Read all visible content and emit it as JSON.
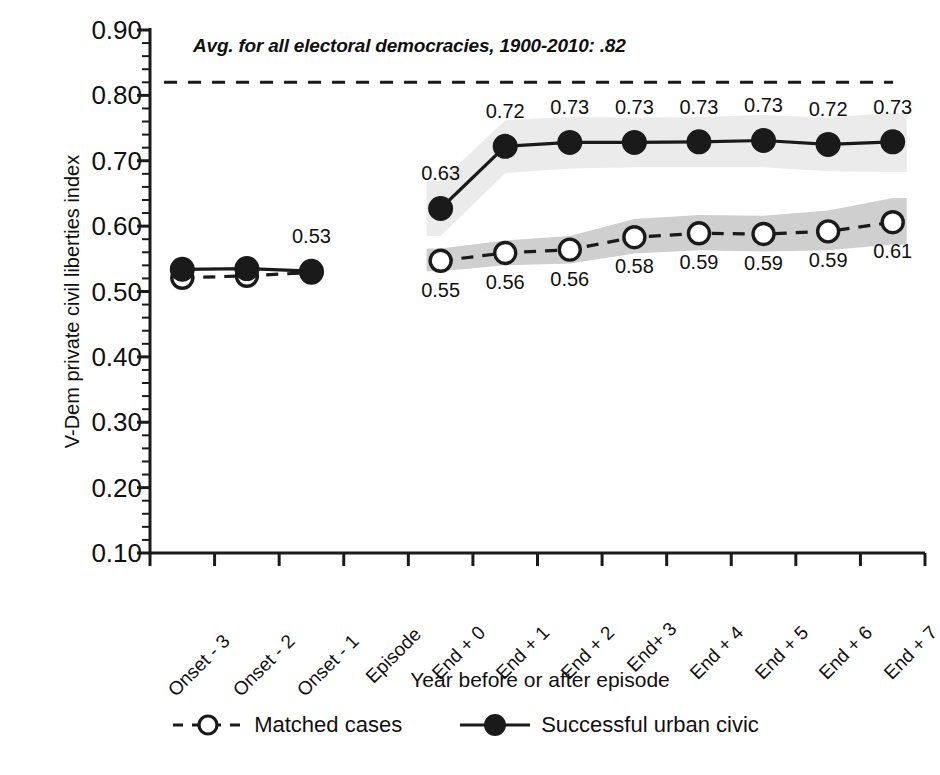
{
  "chart_data": {
    "type": "line",
    "title": "",
    "xlabel": "Year before or after episode",
    "ylabel": "V-Dem private civil liberties index",
    "ylim": [
      0.1,
      0.9
    ],
    "ytick_labels": [
      "0.90",
      "0.80",
      "0.70",
      "0.60",
      "0.50",
      "0.40",
      "0.30",
      "0.20",
      "0.10"
    ],
    "ytick_values": [
      0.9,
      0.8,
      0.7,
      0.6,
      0.5,
      0.4,
      0.3,
      0.2,
      0.1
    ],
    "minor_ticks_per_interval": 5,
    "grid": false,
    "legend_position": "bottom",
    "categories": [
      "Onset - 3",
      "Onset - 2",
      "Onset - 1",
      "Episode",
      "End + 0",
      "End + 1",
      "End + 2",
      "End+ 3",
      "End + 4",
      "End + 5",
      "End + 6",
      "End + 7"
    ],
    "series": [
      {
        "name": "Matched cases",
        "style": "dashed",
        "marker": "open-circle",
        "values": [
          0.521,
          0.524,
          0.529,
          null,
          0.547,
          0.559,
          0.564,
          0.583,
          0.589,
          0.588,
          0.592,
          0.606
        ],
        "labels": [
          "",
          "",
          "",
          "",
          "0.55",
          "0.56",
          "0.56",
          "0.58",
          "0.59",
          "0.59",
          "0.59",
          "0.61"
        ],
        "label_position": "below",
        "band_color": "#cfcfcf",
        "band_lower": [
          null,
          null,
          null,
          null,
          0.531,
          0.54,
          0.543,
          0.558,
          0.563,
          0.561,
          0.563,
          0.572
        ],
        "band_upper": [
          null,
          null,
          null,
          null,
          0.566,
          0.578,
          0.585,
          0.611,
          0.617,
          0.616,
          0.624,
          0.643
        ]
      },
      {
        "name": "Successful urban civic",
        "style": "solid",
        "marker": "filled-circle",
        "values": [
          0.534,
          0.535,
          0.531,
          null,
          0.627,
          0.722,
          0.728,
          0.728,
          0.729,
          0.731,
          0.725,
          0.729
        ],
        "labels": [
          "",
          "",
          "0.53",
          "",
          "0.63",
          "0.72",
          "0.73",
          "0.73",
          "0.73",
          "0.73",
          "0.72",
          "0.73"
        ],
        "label_position": "above",
        "band_color": "#ebebeb",
        "band_lower": [
          null,
          null,
          null,
          null,
          0.585,
          0.681,
          0.688,
          0.69,
          0.69,
          0.69,
          0.684,
          0.683
        ],
        "band_upper": [
          null,
          null,
          null,
          null,
          0.669,
          0.762,
          0.767,
          0.766,
          0.767,
          0.77,
          0.766,
          0.773
        ]
      }
    ],
    "reference_line": {
      "value": 0.82,
      "style": "dashed",
      "label": "Avg. for all electoral democracies, 1900-2010: .82"
    }
  },
  "legend": {
    "items": [
      {
        "label": "Matched cases",
        "marker": "open-circle",
        "line": "dashed"
      },
      {
        "label": "Successful urban civic",
        "marker": "filled-circle",
        "line": "solid"
      }
    ]
  }
}
